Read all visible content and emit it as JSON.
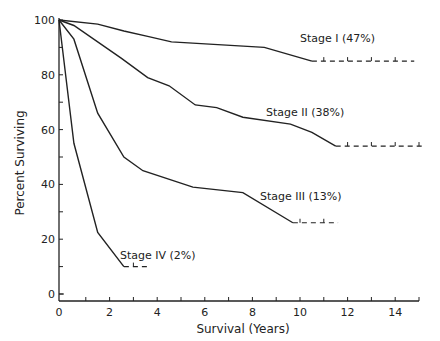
{
  "chart_data": {
    "type": "line",
    "title": "",
    "xlabel": "Survival (Years)",
    "ylabel": "Percent Surviving",
    "xlim": [
      0,
      15
    ],
    "ylim": [
      0,
      100
    ],
    "x_ticks": [
      0,
      2,
      4,
      6,
      8,
      10,
      12,
      14
    ],
    "y_ticks": [
      0,
      20,
      40,
      60,
      80,
      100
    ],
    "grid": false,
    "legend_position": "inline labels at curve ends",
    "series": [
      {
        "name": "Stage I (47%)",
        "label_stage": "Stage I",
        "label_pct": "(47%)",
        "x": [
          0,
          1.5,
          2.6,
          3.6,
          4.6,
          8.5,
          10.5
        ],
        "y": [
          100,
          98.5,
          96,
          94,
          92,
          90,
          85
        ],
        "censored_extension": {
          "from": 10.5,
          "to": 14.8,
          "y": 85
        }
      },
      {
        "name": "Stage II (38%)",
        "label_stage": "Stage II",
        "label_pct": "(38%)",
        "x": [
          0,
          0.5,
          2.5,
          3.6,
          4.5,
          5.6,
          6.5,
          7.6,
          9.6,
          10.5,
          11.5
        ],
        "y": [
          100,
          98,
          86,
          79,
          76,
          69,
          68,
          64.5,
          62,
          59,
          54
        ],
        "censored_extension": {
          "from": 11.5,
          "to": 15.2,
          "y": 54
        }
      },
      {
        "name": "Stage III (13%)",
        "label_stage": "Stage III",
        "label_pct": "(13%)",
        "x": [
          0,
          0.5,
          1.5,
          2.6,
          3.4,
          5.5,
          7.6,
          9.7
        ],
        "y": [
          100,
          93,
          66,
          50,
          45,
          39,
          37,
          26
        ],
        "censored_extension": {
          "from": 9.7,
          "to": 11.6,
          "y": 26
        }
      },
      {
        "name": "Stage IV (2%)",
        "label_stage": "Stage IV",
        "label_pct": "(2%)",
        "x": [
          0,
          0.5,
          1.5,
          2.6
        ],
        "y": [
          100,
          55,
          22.5,
          10
        ],
        "censored_extension": {
          "from": 2.6,
          "to": 3.6,
          "y": 10
        }
      }
    ]
  },
  "labels": {
    "ylabel": "Percent Surviving",
    "xlabel": "Survival (Years)",
    "stage1": "Stage I (47%)",
    "stage2": "Stage II (38%)",
    "stage3": "Stage III (13%)",
    "stage4": "Stage IV (2%)"
  }
}
